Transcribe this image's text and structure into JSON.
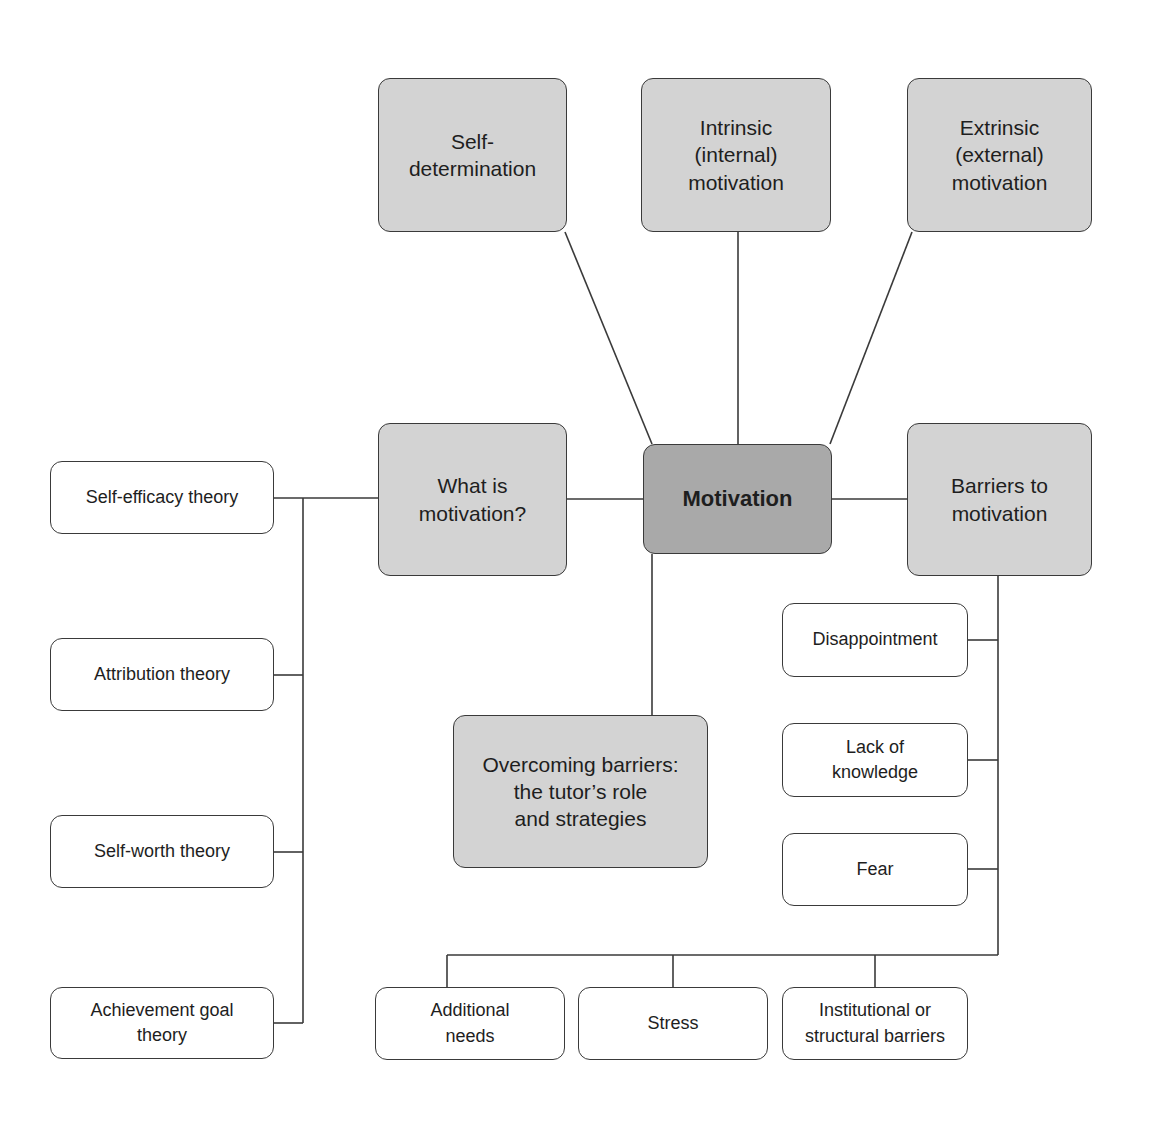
{
  "diagram": {
    "title": "Motivation",
    "colors": {
      "central_fill": "#a9a9a9",
      "major_fill": "#d3d3d3",
      "minor_fill": "#ffffff",
      "line": "#3a3a3a"
    },
    "central": {
      "label": "Motivation"
    },
    "top_nodes": [
      {
        "label": "Self-\ndetermination"
      },
      {
        "label": "Intrinsic\n(internal)\nmotivation"
      },
      {
        "label": "Extrinsic\n(external)\nmotivation"
      }
    ],
    "what_is": {
      "label": "What is\nmotivation?"
    },
    "barriers": {
      "label": "Barriers to\nmotivation"
    },
    "overcoming": {
      "label": "Overcoming barriers:\nthe tutor’s role\nand strategies"
    },
    "theories": [
      {
        "label": "Self-efficacy theory"
      },
      {
        "label": "Attribution theory"
      },
      {
        "label": "Self-worth theory"
      },
      {
        "label": "Achievement goal\ntheory"
      }
    ],
    "barrier_items_side": [
      {
        "label": "Disappointment"
      },
      {
        "label": "Lack of\nknowledge"
      },
      {
        "label": "Fear"
      }
    ],
    "barrier_items_bottom": [
      {
        "label": "Additional\nneeds"
      },
      {
        "label": "Stress"
      },
      {
        "label": "Institutional or\nstructural barriers"
      }
    ]
  }
}
